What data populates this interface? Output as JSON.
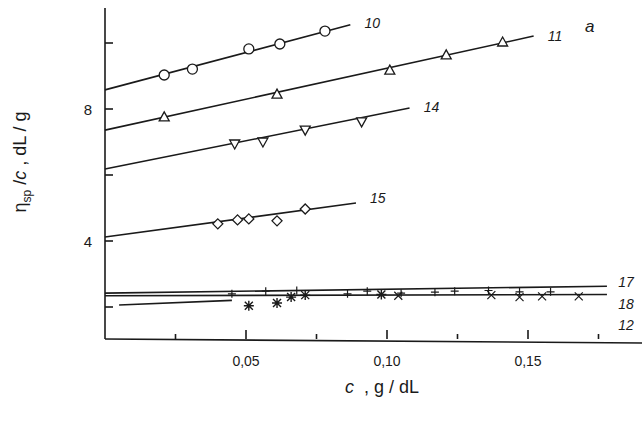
{
  "chart_data": {
    "type": "line",
    "title": "",
    "panel_label": "a",
    "xlabel": "c , g / dL",
    "ylabel": "η_sp / c , dL / g",
    "xlim": [
      0,
      0.18
    ],
    "ylim": [
      1,
      11.2
    ],
    "x_ticks": [
      {
        "value": 0.025,
        "label": ""
      },
      {
        "value": 0.05,
        "label": "0,05"
      },
      {
        "value": 0.075,
        "label": ""
      },
      {
        "value": 0.1,
        "label": "0,10"
      },
      {
        "value": 0.125,
        "label": ""
      },
      {
        "value": 0.15,
        "label": "0,15"
      },
      {
        "value": 0.175,
        "label": ""
      }
    ],
    "y_ticks": [
      {
        "value": 2,
        "label": ""
      },
      {
        "value": 4,
        "label": "4"
      },
      {
        "value": 6,
        "label": ""
      },
      {
        "value": 8,
        "label": "8"
      },
      {
        "value": 10,
        "label": ""
      }
    ],
    "grid": false,
    "legend": "inline labels at line ends",
    "series": [
      {
        "name": "10",
        "marker": "circle",
        "fit": {
          "x0": 0,
          "y0": 8.58,
          "x1": 0.087,
          "y1": 10.55
        },
        "label_pos": [
          0.092,
          10.6
        ],
        "x": [
          0.021,
          0.031,
          0.051,
          0.062,
          0.078
        ],
        "y": [
          9.03,
          9.21,
          9.82,
          9.97,
          10.36
        ]
      },
      {
        "name": "11",
        "marker": "triangle-up",
        "fit": {
          "x0": 0,
          "y0": 7.36,
          "x1": 0.152,
          "y1": 10.21
        },
        "label_pos": [
          0.157,
          10.2
        ],
        "x": [
          0.021,
          0.061,
          0.101,
          0.121,
          0.141
        ],
        "y": [
          7.76,
          8.45,
          9.18,
          9.64,
          10.03
        ]
      },
      {
        "name": "14",
        "marker": "triangle-down",
        "fit": {
          "x0": 0,
          "y0": 6.18,
          "x1": 0.108,
          "y1": 8.03
        },
        "label_pos": [
          0.113,
          8.05
        ],
        "x": [
          0.046,
          0.056,
          0.071,
          0.091
        ],
        "y": [
          6.94,
          7.0,
          7.36,
          7.61
        ]
      },
      {
        "name": "15",
        "marker": "diamond",
        "fit": {
          "x0": 0,
          "y0": 4.12,
          "x1": 0.089,
          "y1": 5.15
        },
        "label_pos": [
          0.094,
          5.3
        ],
        "x": [
          0.04,
          0.047,
          0.051,
          0.061,
          0.071
        ],
        "y": [
          4.52,
          4.64,
          4.67,
          4.61,
          4.97
        ]
      },
      {
        "name": "17",
        "marker": "plus",
        "fit": {
          "x0": 0,
          "y0": 2.42,
          "x1": 0.178,
          "y1": 2.63
        },
        "label_pos": [
          0.182,
          2.75
        ],
        "x": [
          0.045,
          0.057,
          0.068,
          0.086,
          0.093,
          0.105,
          0.117,
          0.124,
          0.136,
          0.147,
          0.158
        ],
        "y": [
          2.4,
          2.48,
          2.5,
          2.4,
          2.48,
          2.42,
          2.45,
          2.48,
          2.5,
          2.46,
          2.46
        ]
      },
      {
        "name": "18",
        "marker": "x",
        "fit": {
          "x0": 0,
          "y0": 2.34,
          "x1": 0.178,
          "y1": 2.38
        },
        "label_pos": [
          0.182,
          2.1
        ],
        "x": [
          0.104,
          0.137,
          0.147,
          0.155,
          0.168
        ],
        "y": [
          2.34,
          2.36,
          2.3,
          2.32,
          2.32
        ]
      },
      {
        "name": "12",
        "marker": "asterisk",
        "fit": {
          "x0": 0.005,
          "y0": 2.06,
          "x1": 0.045,
          "y1": 2.2
        },
        "label_pos": [
          0.182,
          1.45
        ],
        "x": [
          0.051,
          0.061,
          0.066,
          0.071,
          0.098
        ],
        "y": [
          2.04,
          2.12,
          2.3,
          2.36,
          2.38
        ]
      }
    ]
  }
}
